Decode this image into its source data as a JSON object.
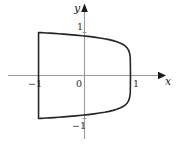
{
  "figure": {
    "name": "superellipse-plot",
    "background_color": "#ffffff",
    "axis_color": "#9a9a9a",
    "arrow_color": "#1a1a1a",
    "curve_color": "#262626",
    "label_color": "#2b2b2b"
  },
  "labels": {
    "y_axis": "y",
    "x_axis": "x",
    "origin": "0",
    "y_positive_tick": "1",
    "y_negative_tick": "−1",
    "x_negative_tick": "−1",
    "x_positive_tick": "1"
  },
  "chart_data": {
    "type": "line",
    "title": "",
    "xlabel": "x",
    "ylabel": "y",
    "xlim": [
      -1.65,
      2.05
    ],
    "ylim": [
      -1.6,
      1.65
    ],
    "grid": false,
    "legend": null,
    "axes": {
      "x_axis_y_value": 0,
      "y_axis_x_value": 0,
      "x_ticks": [
        -1,
        0,
        1
      ],
      "x_tick_labels": [
        "−1",
        "0",
        "1"
      ],
      "y_ticks": [
        -1,
        1
      ],
      "y_tick_labels": [
        "−1",
        "1"
      ],
      "x_arrow": "right",
      "y_arrow": "up"
    },
    "series": [
      {
        "name": "superellipse",
        "equation": "x^4 + y^4 = 1",
        "closed": true,
        "stroke_width_px": 1.6,
        "x": [
          1.0,
          0.995,
          0.98,
          0.957,
          0.924,
          0.882,
          0.831,
          0.771,
          0.702,
          0.623,
          0.534,
          0.436,
          0.327,
          0.209,
          0.08,
          -0.058,
          -0.195,
          -0.327,
          -0.45,
          -0.562,
          -0.663,
          -0.752,
          -0.83,
          -0.895,
          -0.947,
          -0.982,
          -0.999,
          -0.999,
          -0.982,
          -0.947,
          -0.895,
          -0.83,
          -0.752,
          -0.663,
          -0.562,
          -0.45,
          -0.327,
          -0.195,
          -0.058,
          0.08,
          0.209,
          0.327,
          0.436,
          0.534,
          0.623,
          0.702,
          0.771,
          0.831,
          0.882,
          0.924,
          0.957,
          0.98,
          0.995,
          1.0
        ],
        "y": [
          0.0,
          0.417,
          0.519,
          0.59,
          0.645,
          0.689,
          0.726,
          0.758,
          0.786,
          0.811,
          0.834,
          0.855,
          0.874,
          0.892,
          0.909,
          0.924,
          0.938,
          0.951,
          0.962,
          0.971,
          0.979,
          0.985,
          0.99,
          0.994,
          0.997,
          0.999,
          1.0,
          -1.0,
          -0.999,
          -0.997,
          -0.994,
          -0.99,
          -0.985,
          -0.979,
          -0.971,
          -0.962,
          -0.951,
          -0.938,
          -0.924,
          -0.909,
          -0.892,
          -0.874,
          -0.855,
          -0.834,
          -0.811,
          -0.786,
          -0.758,
          -0.726,
          -0.689,
          -0.645,
          -0.59,
          -0.519,
          -0.417,
          0.0
        ]
      }
    ],
    "annotations": [
      {
        "text": "y",
        "role": "y-axis-label",
        "position": "top of vertical axis, left side"
      },
      {
        "text": "x",
        "role": "x-axis-label",
        "position": "right of horizontal axis, below"
      },
      {
        "text": "0",
        "role": "origin-label",
        "position": "below-left of origin"
      },
      {
        "text": "1",
        "role": "y-tick",
        "value": 1
      },
      {
        "text": "−1",
        "role": "y-tick",
        "value": -1
      },
      {
        "text": "−1",
        "role": "x-tick",
        "value": -1
      },
      {
        "text": "1",
        "role": "x-tick",
        "value": 1
      }
    ]
  }
}
